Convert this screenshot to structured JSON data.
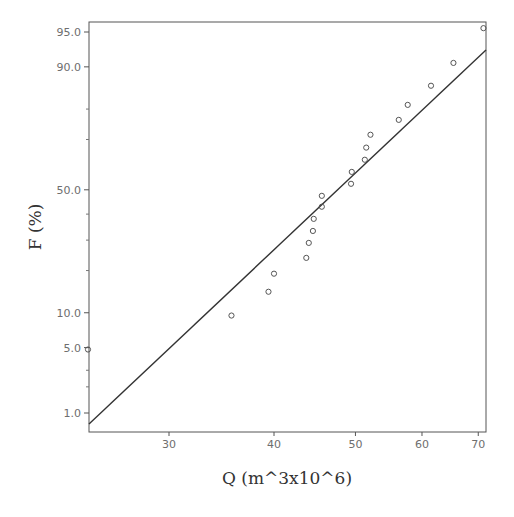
{
  "chart_data": {
    "type": "scatter",
    "title": "",
    "xlabel": "Q (m^3x10^6)",
    "ylabel": "F (%)",
    "x_scale": "log",
    "y_scale": "normal-probability",
    "xlim": [
      24,
      71
    ],
    "ylim": [
      0.7,
      96.5
    ],
    "x_ticks": [
      {
        "value": 30,
        "label": "30"
      },
      {
        "value": 40,
        "label": "40"
      },
      {
        "value": 50,
        "label": "50"
      },
      {
        "value": 60,
        "label": "60"
      },
      {
        "value": 70,
        "label": "70"
      }
    ],
    "y_ticks": [
      {
        "value": 1.0,
        "label": "1.0"
      },
      {
        "value": 5.0,
        "label": "5.0"
      },
      {
        "value": 10.0,
        "label": "10.0"
      },
      {
        "value": 50.0,
        "label": "50.0"
      },
      {
        "value": 90.0,
        "label": "90.0"
      },
      {
        "value": 95.0,
        "label": "95.0"
      }
    ],
    "y_minor_ticks": [
      2,
      3,
      20,
      30,
      40,
      70,
      80
    ],
    "grid": false,
    "legend": null,
    "series": [
      {
        "name": "observed",
        "type": "scatter",
        "marker": "open-circle",
        "points": [
          {
            "x": 24.0,
            "y": 4.8
          },
          {
            "x": 35.6,
            "y": 9.5
          },
          {
            "x": 39.4,
            "y": 14.4
          },
          {
            "x": 40.0,
            "y": 19.1
          },
          {
            "x": 43.7,
            "y": 23.9
          },
          {
            "x": 44.0,
            "y": 29.0
          },
          {
            "x": 44.5,
            "y": 33.4
          },
          {
            "x": 44.6,
            "y": 38.1
          },
          {
            "x": 45.6,
            "y": 43.0
          },
          {
            "x": 45.6,
            "y": 47.5
          },
          {
            "x": 49.4,
            "y": 52.5
          },
          {
            "x": 49.5,
            "y": 57.4
          },
          {
            "x": 51.3,
            "y": 62.3
          },
          {
            "x": 51.5,
            "y": 67.0
          },
          {
            "x": 52.1,
            "y": 71.7
          },
          {
            "x": 56.3,
            "y": 76.7
          },
          {
            "x": 57.7,
            "y": 81.2
          },
          {
            "x": 61.5,
            "y": 86.1
          },
          {
            "x": 65.4,
            "y": 90.7
          },
          {
            "x": 71.0,
            "y": 95.4
          }
        ]
      },
      {
        "name": "fitted",
        "type": "line",
        "points": [
          {
            "x": 24.0,
            "y": 0.8
          },
          {
            "x": 71.0,
            "y": 93.0
          }
        ]
      }
    ]
  }
}
